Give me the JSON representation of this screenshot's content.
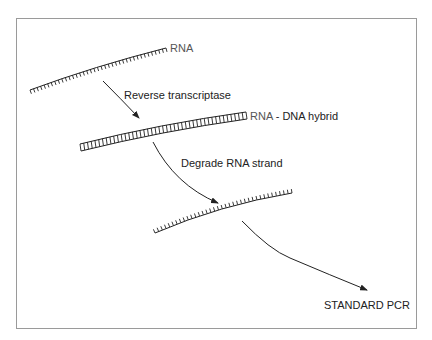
{
  "diagram": {
    "type": "flow",
    "title": "",
    "frame_color": "#9a9a9a",
    "line_color": "#222222",
    "nodes": [
      {
        "id": "rna",
        "kind": "single-strand",
        "label": "RNA",
        "label_color": "#555555"
      },
      {
        "id": "hybrid",
        "kind": "double-strand",
        "label_rna": "RNA",
        "label_sep": " - ",
        "label_dna": "DNA hybrid",
        "label_rna_color": "#555555"
      },
      {
        "id": "cdna",
        "kind": "single-strand",
        "label": ""
      },
      {
        "id": "pcr",
        "kind": "text",
        "label": "STANDARD PCR"
      }
    ],
    "edges": [
      {
        "from": "rna",
        "to": "hybrid",
        "label": "Reverse transcriptase"
      },
      {
        "from": "hybrid",
        "to": "cdna",
        "label": "Degrade RNA strand"
      },
      {
        "from": "cdna",
        "to": "pcr",
        "label": ""
      }
    ]
  }
}
